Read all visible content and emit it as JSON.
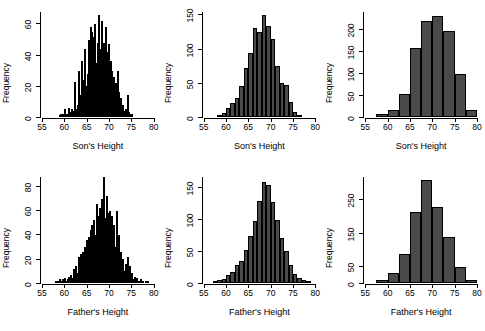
{
  "figure": {
    "title": "",
    "rows": 2,
    "cols": 3,
    "bar_color": "#4a4a4a",
    "bar_border_color": "#000000",
    "background": "#ffffff"
  },
  "chart_data": [
    {
      "type": "bar",
      "panel": "top-left",
      "title": "",
      "xlabel": "Son's Height",
      "ylabel": "Frequency",
      "xlim": [
        55,
        80
      ],
      "ylim": [
        0,
        68
      ],
      "xticks": [
        55,
        60,
        65,
        70,
        75,
        80
      ],
      "yticks": [
        0,
        20,
        40,
        60
      ],
      "grid": false,
      "legend": null,
      "bin_width": 0.25,
      "bin_starts": [
        58.75,
        59.0,
        59.25,
        59.5,
        59.75,
        60.0,
        60.25,
        60.5,
        60.75,
        61.0,
        61.25,
        61.5,
        61.75,
        62.0,
        62.25,
        62.5,
        62.75,
        63.0,
        63.25,
        63.5,
        63.75,
        64.0,
        64.25,
        64.5,
        64.75,
        65.0,
        65.25,
        65.5,
        65.75,
        66.0,
        66.25,
        66.5,
        66.75,
        67.0,
        67.25,
        67.5,
        67.75,
        68.0,
        68.25,
        68.5,
        68.75,
        69.0,
        69.25,
        69.5,
        69.75,
        70.0,
        70.25,
        70.5,
        70.75,
        71.0,
        71.25,
        71.5,
        71.75,
        72.0,
        72.25,
        72.5,
        72.75,
        73.0,
        73.25,
        73.5,
        73.75,
        74.0,
        74.25,
        74.5,
        74.75,
        75.0
      ],
      "values": [
        1,
        2,
        1,
        2,
        1,
        5,
        2,
        2,
        6,
        2,
        3,
        5,
        2,
        4,
        23,
        5,
        8,
        30,
        10,
        14,
        36,
        12,
        24,
        44,
        20,
        28,
        50,
        23,
        58,
        55,
        30,
        52,
        60,
        35,
        48,
        66,
        38,
        44,
        62,
        40,
        48,
        58,
        30,
        42,
        47,
        24,
        36,
        30,
        18,
        26,
        22,
        12,
        30,
        16,
        10,
        12,
        6,
        8,
        4,
        5,
        2,
        14,
        3,
        2,
        1,
        2
      ]
    },
    {
      "type": "bar",
      "panel": "top-middle",
      "title": "",
      "xlabel": "Son's Height",
      "ylabel": "Frequency",
      "xlim": [
        55,
        80
      ],
      "ylim": [
        0,
        155
      ],
      "xticks": [
        55,
        60,
        65,
        70,
        75,
        80
      ],
      "yticks": [
        0,
        50,
        100,
        150
      ],
      "grid": false,
      "legend": null,
      "bin_width": 1,
      "bin_starts": [
        58,
        59,
        60,
        61,
        62,
        63,
        64,
        65,
        66,
        67,
        68,
        69,
        70,
        71,
        72,
        73,
        74,
        75,
        76
      ],
      "values": [
        3,
        6,
        13,
        20,
        28,
        46,
        72,
        95,
        131,
        126,
        150,
        134,
        115,
        75,
        50,
        47,
        22,
        8,
        3
      ]
    },
    {
      "type": "bar",
      "panel": "top-right",
      "title": "",
      "xlabel": "Son's Height",
      "ylabel": "Frequency",
      "xlim": [
        55,
        80
      ],
      "ylim": [
        0,
        240
      ],
      "xticks": [
        55,
        60,
        65,
        70,
        75,
        80
      ],
      "yticks": [
        0,
        50,
        100,
        150,
        200
      ],
      "grid": false,
      "legend": null,
      "bin_width": 2.5,
      "bin_starts": [
        57.5,
        60.0,
        62.5,
        65.0,
        67.5,
        70.0,
        72.5,
        75.0,
        77.5
      ],
      "values": [
        8,
        15,
        53,
        158,
        219,
        232,
        196,
        98,
        15
      ]
    },
    {
      "type": "bar",
      "panel": "bottom-left",
      "title": "",
      "xlabel": "Father's Height",
      "ylabel": "Frequency",
      "xlim": [
        55,
        80
      ],
      "ylim": [
        0,
        88
      ],
      "xticks": [
        55,
        60,
        65,
        70,
        75,
        80
      ],
      "yticks": [
        0,
        20,
        40,
        60,
        80
      ],
      "grid": false,
      "legend": null,
      "bin_width": 0.25,
      "bin_starts": [
        58.0,
        58.25,
        58.5,
        58.75,
        59.0,
        59.25,
        59.5,
        59.75,
        60.0,
        60.25,
        60.5,
        60.75,
        61.0,
        61.25,
        61.5,
        61.75,
        62.0,
        62.25,
        62.5,
        62.75,
        63.0,
        63.25,
        63.5,
        63.75,
        64.0,
        64.25,
        64.5,
        64.75,
        65.0,
        65.25,
        65.5,
        65.75,
        66.0,
        66.25,
        66.5,
        66.75,
        67.0,
        67.25,
        67.5,
        67.75,
        68.0,
        68.25,
        68.5,
        68.75,
        69.0,
        69.25,
        69.5,
        69.75,
        70.0,
        70.25,
        70.5,
        70.75,
        71.0,
        71.25,
        71.5,
        71.75,
        72.0,
        72.25,
        72.5,
        72.75,
        73.0,
        73.25,
        73.5,
        73.75,
        74.0,
        74.25,
        74.5,
        74.75,
        75.0,
        75.25,
        75.5,
        75.75,
        76.0,
        76.5,
        77.0,
        77.5,
        78.0,
        78.5
      ],
      "values": [
        2,
        1,
        2,
        3,
        2,
        1,
        3,
        2,
        4,
        2,
        3,
        5,
        2,
        7,
        4,
        3,
        12,
        5,
        14,
        8,
        22,
        10,
        24,
        12,
        26,
        18,
        30,
        36,
        20,
        38,
        28,
        44,
        48,
        30,
        52,
        40,
        66,
        44,
        56,
        62,
        50,
        70,
        60,
        88,
        54,
        72,
        58,
        46,
        60,
        42,
        56,
        34,
        48,
        30,
        60,
        26,
        40,
        20,
        26,
        14,
        20,
        10,
        16,
        8,
        22,
        6,
        14,
        5,
        8,
        3,
        5,
        2,
        4,
        2,
        3,
        1,
        2,
        1
      ]
    },
    {
      "type": "bar",
      "panel": "bottom-middle",
      "title": "",
      "xlabel": "Father's Height",
      "ylabel": "Frequency",
      "xlim": [
        55,
        80
      ],
      "ylim": [
        0,
        168
      ],
      "xticks": [
        55,
        60,
        65,
        70,
        75,
        80
      ],
      "yticks": [
        0,
        50,
        100,
        150
      ],
      "grid": false,
      "legend": null,
      "bin_width": 1,
      "bin_starts": [
        57,
        58,
        59,
        60,
        61,
        62,
        63,
        64,
        65,
        66,
        67,
        68,
        69,
        70,
        71,
        72,
        73,
        74,
        75,
        76,
        77,
        78
      ],
      "values": [
        2,
        4,
        7,
        12,
        17,
        28,
        35,
        52,
        74,
        98,
        130,
        160,
        155,
        128,
        100,
        72,
        50,
        28,
        14,
        8,
        4,
        2
      ]
    },
    {
      "type": "bar",
      "panel": "bottom-right",
      "title": "",
      "xlabel": "Father's Height",
      "ylabel": "Frequency",
      "xlim": [
        55,
        80
      ],
      "ylim": [
        0,
        320
      ],
      "xticks": [
        55,
        60,
        65,
        70,
        75,
        80
      ],
      "yticks": [
        0,
        50,
        150,
        250
      ],
      "grid": false,
      "legend": null,
      "bin_width": 2.5,
      "bin_starts": [
        57.5,
        60.0,
        62.5,
        65.0,
        67.5,
        70.0,
        72.5,
        75.0,
        77.5
      ],
      "values": [
        8,
        30,
        88,
        215,
        310,
        230,
        140,
        48,
        10
      ]
    }
  ]
}
